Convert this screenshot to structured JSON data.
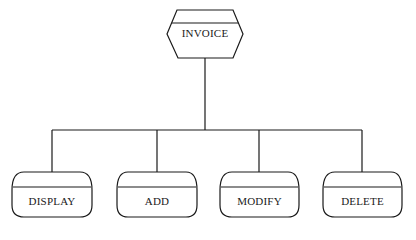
{
  "diagram": {
    "type": "hierarchy-chart",
    "root": {
      "label": "INVOICE",
      "shape": "hexagon-with-header"
    },
    "children": [
      {
        "label": "DISPLAY",
        "shape": "rounded-module-with-header"
      },
      {
        "label": "ADD",
        "shape": "rounded-module-with-header"
      },
      {
        "label": "MODIFY",
        "shape": "rounded-module-with-header"
      },
      {
        "label": "DELETE",
        "shape": "rounded-module-with-header"
      }
    ],
    "colors": {
      "line": "#1a1a1a",
      "background": "#ffffff"
    }
  }
}
